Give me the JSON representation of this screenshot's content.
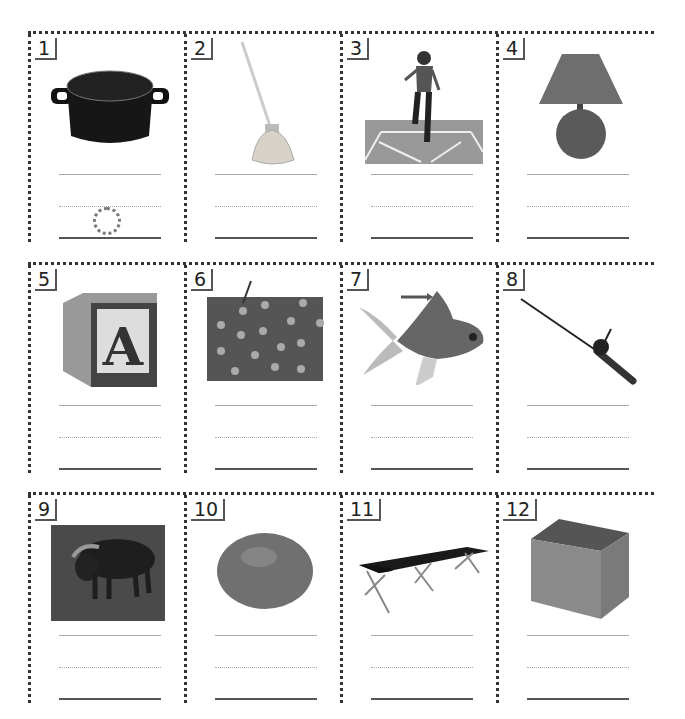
{
  "worksheet": {
    "rows": [
      {
        "cells": [
          {
            "number": "1",
            "picture": "pot",
            "hint_letter_trace": "o"
          },
          {
            "number": "2",
            "picture": "mop"
          },
          {
            "number": "3",
            "picture": "girl hopping hopscotch"
          },
          {
            "number": "4",
            "picture": "lamp"
          }
        ]
      },
      {
        "cells": [
          {
            "number": "5",
            "picture": "alphabet block A"
          },
          {
            "number": "6",
            "picture": "polka-dot fabric with arrow to dot"
          },
          {
            "number": "7",
            "picture": "goldfish with arrow to fin"
          },
          {
            "number": "8",
            "picture": "fishing rod"
          }
        ]
      },
      {
        "cells": [
          {
            "number": "9",
            "picture": "ox"
          },
          {
            "number": "10",
            "picture": "egg"
          },
          {
            "number": "11",
            "picture": "cot"
          },
          {
            "number": "12",
            "picture": "box"
          }
        ]
      }
    ],
    "writing_lines_per_cell": 3,
    "colors": {
      "border": "#333333",
      "line": "#aaaaaa",
      "baseline": "#555555",
      "trace": "#777777"
    }
  }
}
